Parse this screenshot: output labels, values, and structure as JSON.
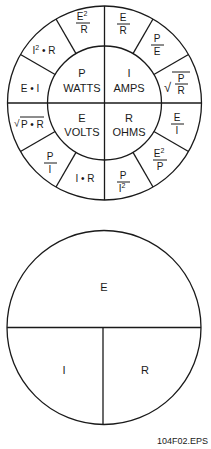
{
  "wheel": {
    "center_quadrants": [
      {
        "symbol": "P",
        "unit": "WATTS"
      },
      {
        "symbol": "I",
        "unit": "AMPS"
      },
      {
        "symbol": "E",
        "unit": "VOLTS"
      },
      {
        "symbol": "R",
        "unit": "OHMS"
      }
    ],
    "formulas": {
      "p_top": {
        "num": "E",
        "sup": "2",
        "den": "R"
      },
      "p_mid": {
        "text": "I",
        "sup": "2",
        "rest": " • R"
      },
      "p_low": {
        "text": "E • I"
      },
      "i_top": {
        "num": "E",
        "den": "R"
      },
      "i_mid": {
        "num": "P",
        "den": "E"
      },
      "i_low": {
        "num": "P",
        "den": "R",
        "root": "√"
      },
      "e_top": {
        "text": "P • R",
        "root": "√"
      },
      "e_mid": {
        "num": "P",
        "den": "I"
      },
      "e_low": {
        "text": "I • R"
      },
      "r_top": {
        "num": "E",
        "den": "I"
      },
      "r_mid": {
        "num": "E",
        "sup": "2",
        "den": "P"
      },
      "r_low": {
        "num": "P",
        "den": "I",
        "densup": "2"
      }
    }
  },
  "triangle_circle": {
    "top": "E",
    "bottom_left": "I",
    "bottom_right": "R"
  },
  "caption": "104F02.EPS",
  "colors": {
    "line": "#1a1a1a",
    "background": "#ffffff"
  }
}
